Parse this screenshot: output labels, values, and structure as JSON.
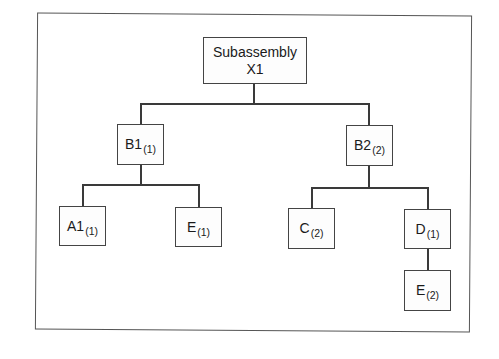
{
  "diagram": {
    "type": "product-structure-tree",
    "root": {
      "label_line1": "Subassembly",
      "label_line2": "X1"
    },
    "nodes": [
      {
        "id": "B1",
        "name": "B1",
        "qty": "(1)",
        "parent": "X1"
      },
      {
        "id": "B2",
        "name": "B2",
        "qty": "(2)",
        "parent": "X1"
      },
      {
        "id": "A1",
        "name": "A1",
        "qty": "(1)",
        "parent": "B1"
      },
      {
        "id": "E1",
        "name": "E",
        "qty": "(1)",
        "parent": "B1"
      },
      {
        "id": "C2",
        "name": "C",
        "qty": "(2)",
        "parent": "B2"
      },
      {
        "id": "D1",
        "name": "D",
        "qty": "(1)",
        "parent": "B2"
      },
      {
        "id": "E2",
        "name": "E",
        "qty": "(2)",
        "parent": "D1"
      }
    ],
    "colors": {
      "line": "#3a3a3a",
      "box_border": "#444444",
      "background": "#ffffff"
    }
  }
}
